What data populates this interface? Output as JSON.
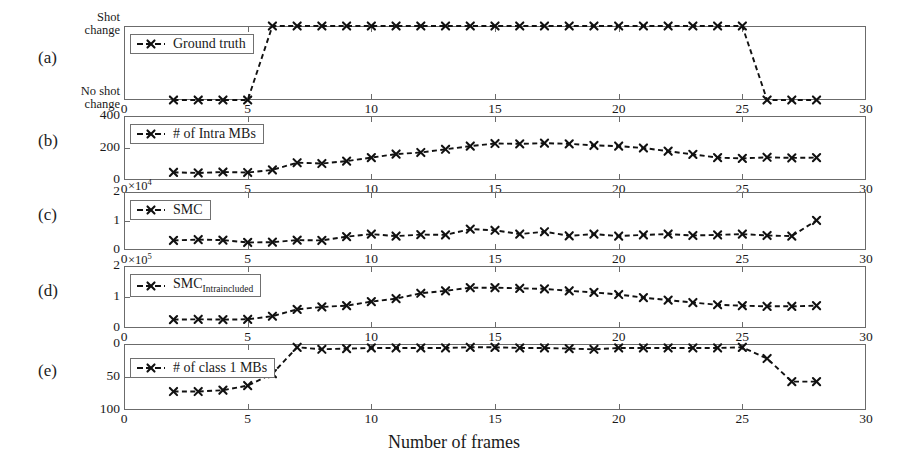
{
  "figure": {
    "xlabel": "Number of frames",
    "panel_letters": [
      "(a)",
      "(b)",
      "(c)",
      "(d)",
      "(e)"
    ],
    "xlim": [
      0,
      30
    ],
    "xticks": [
      0,
      5,
      10,
      15,
      20,
      25,
      30
    ],
    "xticklabels": [
      "0",
      "5",
      "10",
      "15",
      "20",
      "25",
      "30"
    ],
    "marker": "x",
    "linestyle": "dashed",
    "series_color": "#111111"
  },
  "chart_data": [
    {
      "type": "line",
      "panel": "(a)",
      "legend": "Ground truth",
      "title": "",
      "xlabel": "",
      "ylabel": "",
      "xlim": [
        0,
        30
      ],
      "ylim": [
        0,
        1
      ],
      "yticks": [
        0,
        1
      ],
      "yticklabels": [
        "No shot change",
        "Shot change"
      ],
      "grid": false,
      "x": [
        2,
        3,
        4,
        5,
        6,
        7,
        8,
        9,
        10,
        11,
        12,
        13,
        14,
        15,
        16,
        17,
        18,
        19,
        20,
        21,
        22,
        23,
        24,
        25,
        26,
        27,
        28
      ],
      "values": [
        0,
        0,
        0,
        0,
        1,
        1,
        1,
        1,
        1,
        1,
        1,
        1,
        1,
        1,
        1,
        1,
        1,
        1,
        1,
        1,
        1,
        1,
        1,
        1,
        0,
        0,
        0
      ]
    },
    {
      "type": "line",
      "panel": "(b)",
      "legend": "# of Intra MBs",
      "title": "",
      "xlabel": "",
      "ylabel": "",
      "xlim": [
        0,
        30
      ],
      "ylim": [
        0,
        400
      ],
      "yticks": [
        0,
        200,
        400
      ],
      "yticklabels": [
        "0",
        "200",
        "400"
      ],
      "grid": false,
      "x": [
        2,
        3,
        4,
        5,
        6,
        7,
        8,
        9,
        10,
        11,
        12,
        13,
        14,
        15,
        16,
        17,
        18,
        19,
        20,
        21,
        22,
        23,
        24,
        25,
        26,
        27,
        28
      ],
      "values": [
        48,
        44,
        50,
        47,
        63,
        108,
        103,
        118,
        140,
        162,
        172,
        192,
        212,
        228,
        226,
        230,
        226,
        216,
        212,
        200,
        180,
        160,
        140,
        135,
        142,
        138,
        140
      ]
    },
    {
      "type": "line",
      "panel": "(c)",
      "legend": "SMC",
      "title": "",
      "xlabel": "",
      "ylabel": "",
      "y_multiplier": "×10⁴",
      "xlim": [
        0,
        30
      ],
      "ylim": [
        0,
        2
      ],
      "yticks": [
        0,
        1,
        2
      ],
      "yticklabels": [
        "0",
        "1",
        "2"
      ],
      "grid": false,
      "x": [
        2,
        3,
        4,
        5,
        6,
        7,
        8,
        9,
        10,
        11,
        12,
        13,
        14,
        15,
        16,
        17,
        18,
        19,
        20,
        21,
        22,
        23,
        24,
        25,
        26,
        27,
        28
      ],
      "values": [
        0.33,
        0.36,
        0.34,
        0.26,
        0.27,
        0.34,
        0.33,
        0.46,
        0.55,
        0.48,
        0.53,
        0.52,
        0.72,
        0.68,
        0.55,
        0.63,
        0.49,
        0.55,
        0.48,
        0.52,
        0.55,
        0.5,
        0.52,
        0.55,
        0.5,
        0.48,
        1.02
      ]
    },
    {
      "type": "line",
      "panel": "(d)",
      "legend": "SMC_Intraincluded",
      "legend_base": "SMC",
      "legend_subscript": "Intraincluded",
      "title": "",
      "xlabel": "",
      "ylabel": "",
      "y_multiplier": "×10⁵",
      "xlim": [
        0,
        30
      ],
      "ylim": [
        0,
        2
      ],
      "yticks": [
        0,
        1,
        2
      ],
      "yticklabels": [
        "0",
        "1",
        "2"
      ],
      "grid": false,
      "x": [
        2,
        3,
        4,
        5,
        6,
        7,
        8,
        9,
        10,
        11,
        12,
        13,
        14,
        15,
        16,
        17,
        18,
        19,
        20,
        21,
        22,
        23,
        24,
        25,
        26,
        27,
        28
      ],
      "values": [
        0.27,
        0.28,
        0.27,
        0.28,
        0.38,
        0.6,
        0.68,
        0.72,
        0.85,
        0.95,
        1.12,
        1.2,
        1.3,
        1.3,
        1.28,
        1.26,
        1.2,
        1.15,
        1.08,
        0.98,
        0.9,
        0.82,
        0.75,
        0.72,
        0.7,
        0.7,
        0.72
      ]
    },
    {
      "type": "line",
      "panel": "(e)",
      "legend": "# of class 1 MBs",
      "title": "",
      "xlabel": "",
      "ylabel": "",
      "y_inverted": true,
      "xlim": [
        0,
        30
      ],
      "ylim": [
        0,
        100
      ],
      "yticks": [
        0,
        50,
        100
      ],
      "yticklabels": [
        "0",
        "50",
        "100"
      ],
      "grid": false,
      "x": [
        2,
        3,
        4,
        5,
        6,
        7,
        8,
        9,
        10,
        11,
        12,
        13,
        14,
        15,
        16,
        17,
        18,
        19,
        20,
        21,
        22,
        23,
        24,
        25,
        26,
        27,
        28
      ],
      "values": [
        72,
        72,
        70,
        63,
        45,
        5,
        8,
        7,
        6,
        6,
        6,
        6,
        5,
        5,
        6,
        6,
        7,
        8,
        6,
        6,
        6,
        6,
        6,
        5,
        22,
        57,
        57
      ]
    }
  ]
}
